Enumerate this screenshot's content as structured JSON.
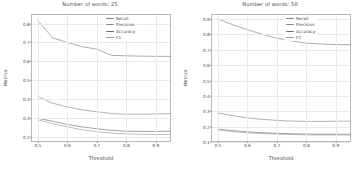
{
  "figure": {
    "panels": [
      {
        "id": "panel-words-25",
        "title": "Number of words: 25",
        "xlabel": "Threshold",
        "ylabel": "Metrics",
        "xticks": [
          "0.5",
          "0.6",
          "0.7",
          "0.8",
          "0.9"
        ],
        "yticks": [
          "0.2",
          "0.3",
          "0.4",
          "0.5",
          "0.6",
          "0.7",
          "0.8"
        ],
        "legend": [
          "Recall",
          "Precision",
          "Accuracy",
          "F1"
        ]
      },
      {
        "id": "panel-words-50",
        "title": "Number of words: 50",
        "xlabel": "Threshold",
        "ylabel": "Metrics",
        "xticks": [
          "0.5",
          "0.6",
          "0.7",
          "0.8",
          "0.9"
        ],
        "yticks": [
          "0.1",
          "0.2",
          "0.3",
          "0.4",
          "0.5",
          "0.6",
          "0.7",
          "0.8",
          "0.9"
        ],
        "legend": [
          "Recall",
          "Precision",
          "Accuracy",
          "F1"
        ]
      }
    ]
  },
  "colors": {
    "recall": "#7f7f7f",
    "precision": "#8a8a8a",
    "accuracy": "#707070",
    "f1": "#9a9a9a",
    "axis": "#b9b9b9",
    "grid": "#e9e9e9",
    "text": "#444444",
    "background": "#ffffff"
  },
  "chart_data": [
    {
      "type": "line",
      "title": "Number of words: 25",
      "xlabel": "Threshold",
      "ylabel": "Metrics",
      "xlim": [
        0.48,
        0.955
      ],
      "ylim": [
        0.17,
        0.845
      ],
      "grid": true,
      "legend_position": "upper-right",
      "x": [
        0.5,
        0.55,
        0.6,
        0.65,
        0.7,
        0.75,
        0.8,
        0.85,
        0.9,
        0.95
      ],
      "series": [
        {
          "name": "Recall",
          "values": [
            0.815,
            0.725,
            0.7,
            0.678,
            0.665,
            0.632,
            0.63,
            0.628,
            0.627,
            0.627
          ]
        },
        {
          "name": "Precision",
          "values": [
            0.415,
            0.38,
            0.36,
            0.345,
            0.335,
            0.325,
            0.322,
            0.322,
            0.323,
            0.325
          ]
        },
        {
          "name": "Accuracy",
          "values": [
            0.3,
            0.285,
            0.268,
            0.255,
            0.245,
            0.237,
            0.232,
            0.231,
            0.231,
            0.232
          ]
        },
        {
          "name": "F1",
          "values": [
            0.292,
            0.272,
            0.255,
            0.24,
            0.23,
            0.222,
            0.218,
            0.216,
            0.215,
            0.215
          ]
        }
      ]
    },
    {
      "type": "line",
      "title": "Number of words: 50",
      "xlabel": "Threshold",
      "ylabel": "Metrics",
      "xlim": [
        0.48,
        0.955
      ],
      "ylim": [
        0.095,
        0.925
      ],
      "grid": true,
      "legend_position": "upper-right",
      "x": [
        0.5,
        0.55,
        0.6,
        0.65,
        0.7,
        0.75,
        0.8,
        0.85,
        0.9,
        0.95
      ],
      "series": [
        {
          "name": "Recall",
          "values": [
            0.9,
            0.862,
            0.83,
            0.8,
            0.775,
            0.757,
            0.742,
            0.737,
            0.733,
            0.733
          ]
        },
        {
          "name": "Precision",
          "values": [
            0.29,
            0.272,
            0.258,
            0.248,
            0.242,
            0.237,
            0.235,
            0.235,
            0.236,
            0.237
          ]
        },
        {
          "name": "Accuracy",
          "values": [
            0.185,
            0.175,
            0.167,
            0.162,
            0.158,
            0.155,
            0.153,
            0.152,
            0.152,
            0.152
          ]
        },
        {
          "name": "F1",
          "values": [
            0.18,
            0.169,
            0.161,
            0.156,
            0.153,
            0.15,
            0.148,
            0.147,
            0.147,
            0.147
          ]
        }
      ]
    }
  ]
}
